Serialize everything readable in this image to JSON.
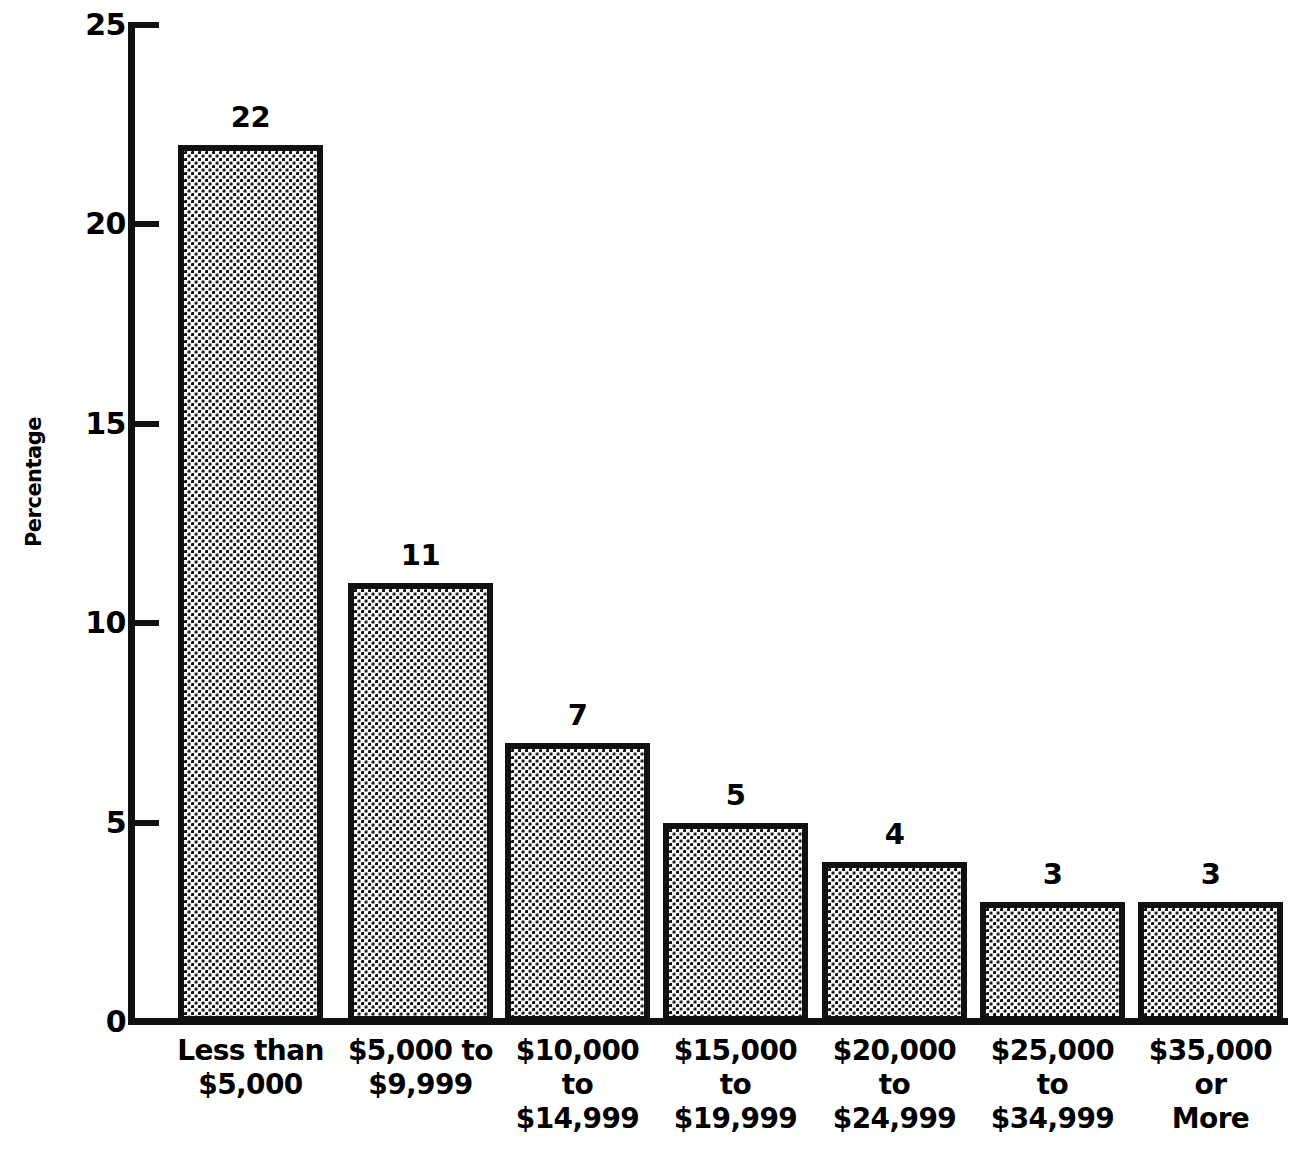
{
  "chart_data": {
    "type": "bar",
    "title": "",
    "subtitle": "",
    "xlabel": "",
    "ylabel": "Percentage",
    "ylim": [
      0,
      25
    ],
    "ytick_labels": [
      "0",
      "5",
      "10",
      "15",
      "20",
      "25"
    ],
    "ytick_values": [
      0,
      5,
      10,
      15,
      20,
      25
    ],
    "grid": false,
    "legend": null,
    "categories": [
      "Less than\n$5,000",
      "$5,000 to\n$9,999",
      "$10,000\nto\n$14,999",
      "$15,000\nto\n$19,999",
      "$20,000\nto\n$24,999",
      "$25,000\nto\n$34,999",
      "$35,000\nor\nMore"
    ],
    "values": [
      22,
      11,
      7,
      5,
      4,
      3,
      3
    ],
    "value_labels": [
      "22",
      "11",
      "7",
      "5",
      "4",
      "3",
      "3"
    ],
    "bar_fill": "dot-screen-halftone",
    "bar_outline_color": "#111111",
    "background_color": "#ffffff"
  },
  "axis": {
    "y_title": "Percentage",
    "ticks": [
      {
        "label": "25",
        "value": 25
      },
      {
        "label": "20",
        "value": 20
      },
      {
        "label": "15",
        "value": 15
      },
      {
        "label": "10",
        "value": 10
      },
      {
        "label": "5",
        "value": 5
      },
      {
        "label": "0",
        "value": 0
      }
    ]
  }
}
